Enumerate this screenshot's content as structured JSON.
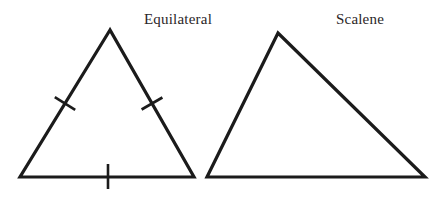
{
  "figure": {
    "width": 442,
    "height": 199,
    "background": "#ffffff",
    "stroke_color": "#1b1b1b",
    "stroke_width": 3.2,
    "tick_width": 2.6,
    "label_color": "#2b2627",
    "triangles": [
      {
        "name": "equilateral-triangle",
        "label": "Equilateral",
        "label_x": 178,
        "label_y": 11,
        "points": "110,30 20,177 194,177",
        "ticks": [
          {
            "side": "left-side",
            "x1": 54.8,
            "y1": 97.2,
            "x2": 75.2,
            "y2": 109.8
          },
          {
            "side": "right-side",
            "x1": 141.6,
            "y1": 109.5,
            "x2": 162.4,
            "y2": 97.5
          },
          {
            "side": "bottom-side",
            "x1": 108,
            "y1": 164,
            "x2": 108,
            "y2": 189
          }
        ]
      },
      {
        "name": "scalene-triangle",
        "label": "Scalene",
        "label_x": 360,
        "label_y": 11,
        "points": "278,33 207,177 425,177",
        "ticks": []
      }
    ]
  }
}
